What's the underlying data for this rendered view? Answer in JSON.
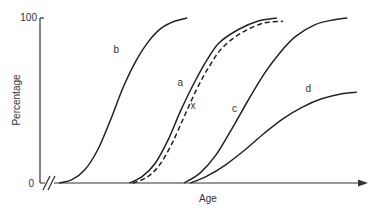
{
  "chart_data": {
    "type": "line",
    "title": "",
    "xlabel": "Age",
    "ylabel": "Percentage",
    "xlim": [
      0,
      100
    ],
    "ylim": [
      0,
      100
    ],
    "x_axis_break": true,
    "x_axis_arrow": true,
    "grid": false,
    "legend": "none",
    "y_ticks": [
      {
        "value": 0,
        "label": "0"
      },
      {
        "value": 100,
        "label": "100"
      }
    ],
    "series": [
      {
        "name": "b",
        "style": "solid",
        "points": [
          [
            6,
            0
          ],
          [
            10,
            2
          ],
          [
            14,
            8
          ],
          [
            18,
            20
          ],
          [
            22,
            38
          ],
          [
            26,
            58
          ],
          [
            30,
            74
          ],
          [
            34,
            86
          ],
          [
            38,
            94
          ],
          [
            42,
            98
          ],
          [
            46,
            100
          ]
        ]
      },
      {
        "name": "a",
        "style": "solid",
        "points": [
          [
            28,
            0
          ],
          [
            32,
            4
          ],
          [
            36,
            12
          ],
          [
            40,
            26
          ],
          [
            44,
            44
          ],
          [
            48,
            60
          ],
          [
            52,
            74
          ],
          [
            56,
            85
          ],
          [
            62,
            93
          ],
          [
            68,
            98
          ],
          [
            74,
            100
          ]
        ]
      },
      {
        "name": "x",
        "style": "dashed",
        "points": [
          [
            29,
            0
          ],
          [
            33,
            3
          ],
          [
            37,
            10
          ],
          [
            41,
            23
          ],
          [
            45,
            40
          ],
          [
            49,
            57
          ],
          [
            53,
            71
          ],
          [
            57,
            82
          ],
          [
            63,
            91
          ],
          [
            70,
            97
          ],
          [
            76,
            98
          ]
        ]
      },
      {
        "name": "c",
        "style": "solid",
        "points": [
          [
            45,
            0
          ],
          [
            50,
            6
          ],
          [
            55,
            17
          ],
          [
            60,
            33
          ],
          [
            65,
            50
          ],
          [
            70,
            66
          ],
          [
            75,
            79
          ],
          [
            80,
            89
          ],
          [
            86,
            96
          ],
          [
            92,
            99
          ],
          [
            96,
            100
          ]
        ]
      },
      {
        "name": "d",
        "style": "solid",
        "points": [
          [
            47,
            0
          ],
          [
            52,
            4
          ],
          [
            58,
            11
          ],
          [
            64,
            20
          ],
          [
            70,
            30
          ],
          [
            76,
            39
          ],
          [
            82,
            46
          ],
          [
            88,
            51
          ],
          [
            94,
            54
          ],
          [
            99,
            55
          ]
        ]
      }
    ],
    "curve_labels": [
      {
        "series": "b",
        "text": "b",
        "at": [
          23,
          79
        ]
      },
      {
        "series": "a",
        "text": "a",
        "at": [
          43,
          59
        ]
      },
      {
        "series": "x",
        "text": "x",
        "at": [
          47,
          45
        ]
      },
      {
        "series": "c",
        "text": "c",
        "at": [
          60,
          43
        ]
      },
      {
        "series": "d",
        "text": "d",
        "at": [
          83,
          55
        ]
      }
    ]
  }
}
